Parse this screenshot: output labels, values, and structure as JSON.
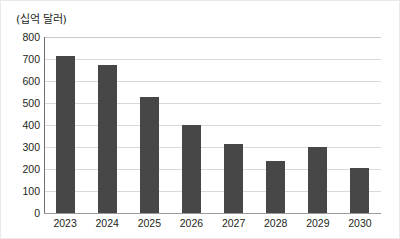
{
  "chart_data": {
    "type": "bar",
    "title": "",
    "subtitle": "",
    "unit_label": "(십억 달러)",
    "xlabel": "",
    "ylabel": "",
    "categories": [
      "2023",
      "2024",
      "2025",
      "2026",
      "2027",
      "2028",
      "2029",
      "2030"
    ],
    "values": [
      715,
      675,
      528,
      400,
      315,
      237,
      300,
      205
    ],
    "ylim": [
      0,
      800
    ],
    "ytick_labels": [
      "800",
      "700",
      "600",
      "500",
      "400",
      "300",
      "200",
      "100",
      "0"
    ],
    "ytick_values": [
      800,
      700,
      600,
      500,
      400,
      300,
      200,
      100,
      0
    ],
    "grid": true,
    "legend": null,
    "series": [
      {
        "name": "",
        "color": "#474747",
        "values": [
          715,
          675,
          528,
          400,
          315,
          237,
          300,
          205
        ]
      }
    ],
    "colors": {
      "bar": "#474747",
      "gridline": "#d9d9d9",
      "axis": "#6e6e6e",
      "text": "#231f20",
      "background": "#ffffff",
      "border": "#e9e9e9"
    }
  }
}
